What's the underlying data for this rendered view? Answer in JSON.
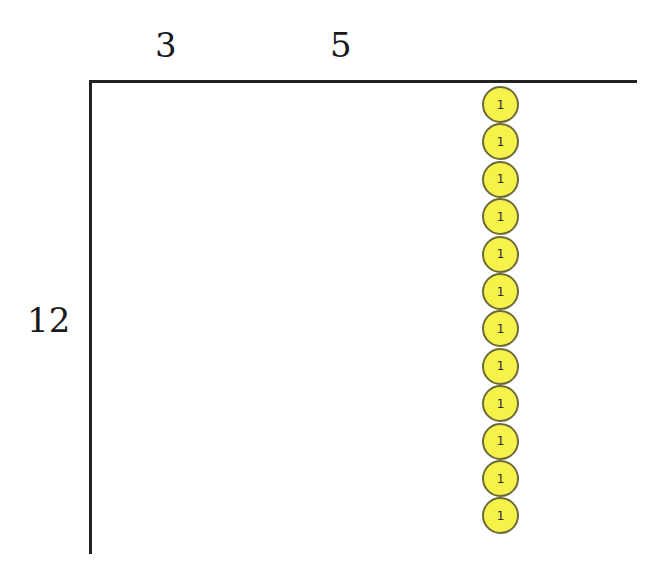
{
  "diagram": {
    "type": "division-area-model",
    "top_labels": [
      {
        "text": "3",
        "x": 155
      },
      {
        "text": "5",
        "x": 330
      }
    ],
    "side_label": "12",
    "disc_color": "#f7f24a",
    "disc_border_color": "#6b6a3a",
    "line_color": "#222222",
    "discs": [
      {
        "value": "1"
      },
      {
        "value": "1"
      },
      {
        "value": "1"
      },
      {
        "value": "1"
      },
      {
        "value": "1"
      },
      {
        "value": "1"
      },
      {
        "value": "1"
      },
      {
        "value": "1"
      },
      {
        "value": "1"
      },
      {
        "value": "1"
      },
      {
        "value": "1"
      },
      {
        "value": "1"
      }
    ]
  }
}
